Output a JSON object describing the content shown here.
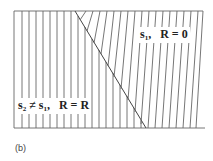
{
  "figure": {
    "label_region_1": {
      "symbol": "s",
      "sub": "1",
      "sep": ",",
      "relation": "R = 0"
    },
    "label_region_2": {
      "symbol_a": "s",
      "sub_a": "2",
      "neq": " ≠ ",
      "symbol_b": "s",
      "sub_b": "1",
      "sep": ",",
      "relation": "R = R"
    },
    "caption": "(b)",
    "colors": {
      "line": "#555555",
      "background": "#ffffff"
    }
  }
}
